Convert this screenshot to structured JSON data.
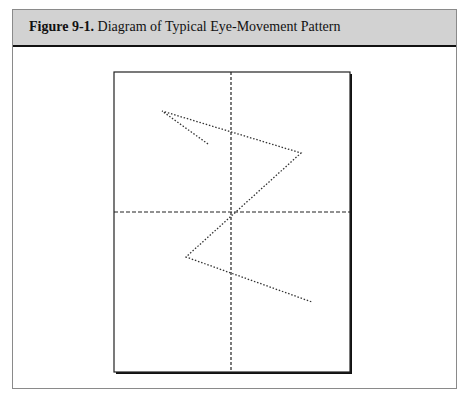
{
  "figure": {
    "label": "Figure 9-1.",
    "title": "Diagram of Typical Eye-Movement Pattern"
  },
  "diagram": {
    "page": {
      "x": 114,
      "y": 72,
      "w": 236,
      "h": 300
    },
    "crosshair": {
      "vx": 231,
      "hy": 212
    },
    "eye_path": [
      [
        208,
        144
      ],
      [
        162,
        111
      ],
      [
        301,
        153
      ],
      [
        186,
        257
      ],
      [
        312,
        302
      ]
    ]
  }
}
